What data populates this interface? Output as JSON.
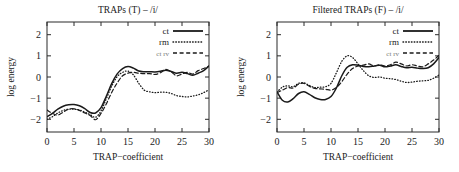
{
  "chart_data": [
    {
      "type": "line",
      "panel": "left",
      "title": "TRAPs (T) – /i/",
      "xlabel": "TRAP−coefficient",
      "ylabel": "log energy",
      "xlim": [
        0,
        30
      ],
      "ylim": [
        -2.6,
        2.6
      ],
      "xticks": [
        0,
        5,
        10,
        15,
        20,
        25,
        30
      ],
      "yticks": [
        2,
        1,
        0,
        -1,
        -2
      ],
      "xticklabels": [
        "0",
        "5",
        "10",
        "15",
        "20",
        "25",
        "30"
      ],
      "yticklabels": [
        "2",
        "1",
        "0",
        "−1",
        "−2"
      ],
      "grid": false,
      "legend_position": "top-right",
      "legend": [
        "ct",
        "rm",
        "ct rv"
      ],
      "x": [
        0,
        1,
        2,
        3,
        4,
        5,
        6,
        7,
        8,
        9,
        10,
        11,
        12,
        13,
        14,
        15,
        16,
        17,
        18,
        19,
        20,
        21,
        22,
        23,
        24,
        25,
        26,
        27,
        28,
        29,
        30
      ],
      "series": [
        {
          "name": "ct",
          "style": "solid",
          "values": [
            -1.88,
            -1.72,
            -1.52,
            -1.38,
            -1.31,
            -1.3,
            -1.36,
            -1.5,
            -1.68,
            -1.7,
            -1.45,
            -0.9,
            -0.3,
            0.15,
            0.4,
            0.5,
            0.42,
            0.28,
            0.25,
            0.25,
            0.24,
            0.27,
            0.32,
            0.26,
            0.18,
            0.22,
            0.16,
            0.08,
            0.18,
            0.3,
            0.52
          ]
        },
        {
          "name": "rm",
          "style": "dotted",
          "values": [
            -2.0,
            -1.88,
            -1.7,
            -1.58,
            -1.52,
            -1.52,
            -1.56,
            -1.66,
            -1.78,
            -1.9,
            -1.6,
            -1.02,
            -0.42,
            0.02,
            0.22,
            0.28,
            0.1,
            -0.3,
            -0.62,
            -0.7,
            -0.74,
            -0.72,
            -0.72,
            -0.78,
            -0.88,
            -0.92,
            -0.94,
            -0.9,
            -0.84,
            -0.74,
            -0.6
          ]
        },
        {
          "name": "ct rv",
          "style": "dashed",
          "values": [
            -1.56,
            -1.72,
            -1.8,
            -1.66,
            -1.52,
            -1.5,
            -1.58,
            -1.7,
            -1.82,
            -2.02,
            -1.72,
            -1.26,
            -0.72,
            -0.28,
            0.06,
            0.18,
            0.22,
            0.18,
            0.16,
            0.16,
            0.12,
            0.2,
            0.36,
            0.24,
            0.06,
            0.14,
            0.22,
            0.14,
            0.3,
            0.4,
            0.52
          ]
        }
      ]
    },
    {
      "type": "line",
      "panel": "right",
      "title": "Filtered TRAPs (F) – /i/",
      "xlabel": "TRAP−coefficient",
      "ylabel": "log energy",
      "xlim": [
        0,
        30
      ],
      "ylim": [
        -2.6,
        2.6
      ],
      "xticks": [
        0,
        5,
        10,
        15,
        20,
        25,
        30
      ],
      "yticks": [
        2,
        1,
        0,
        -1,
        -2
      ],
      "xticklabels": [
        "0",
        "5",
        "10",
        "15",
        "20",
        "25",
        "30"
      ],
      "yticklabels": [
        "2",
        "1",
        "0",
        "−1",
        "−2"
      ],
      "grid": false,
      "legend_position": "top-right",
      "legend": [
        "ct",
        "rm",
        "ct rv"
      ],
      "x": [
        0,
        1,
        2,
        3,
        4,
        5,
        6,
        7,
        8,
        9,
        10,
        11,
        12,
        13,
        14,
        15,
        16,
        17,
        18,
        19,
        20,
        21,
        22,
        23,
        24,
        25,
        26,
        27,
        28,
        29,
        30
      ],
      "series": [
        {
          "name": "ct",
          "style": "solid",
          "values": [
            -0.7,
            -1.1,
            -1.18,
            -1.02,
            -0.78,
            -0.7,
            -0.82,
            -0.98,
            -1.06,
            -1.06,
            -0.92,
            -0.52,
            0.06,
            0.46,
            0.58,
            0.56,
            0.5,
            0.48,
            0.52,
            0.56,
            0.48,
            0.52,
            0.58,
            0.5,
            0.44,
            0.46,
            0.42,
            0.4,
            0.44,
            0.62,
            0.92
          ]
        },
        {
          "name": "rm",
          "style": "dotted",
          "values": [
            -0.72,
            -0.48,
            -0.42,
            -0.46,
            -0.3,
            -0.28,
            -0.4,
            -0.5,
            -0.48,
            -0.46,
            -0.3,
            0.2,
            0.74,
            1.0,
            0.92,
            0.62,
            0.3,
            0.06,
            -0.02,
            0.0,
            -0.06,
            -0.08,
            -0.12,
            -0.2,
            -0.26,
            -0.24,
            -0.2,
            -0.18,
            -0.16,
            -0.06,
            0.1
          ]
        },
        {
          "name": "ct rv",
          "style": "dashed",
          "values": [
            -0.74,
            -0.62,
            -0.5,
            -0.52,
            -0.34,
            -0.3,
            -0.44,
            -0.54,
            -0.56,
            -0.58,
            -0.62,
            -0.5,
            -0.22,
            0.14,
            0.4,
            0.52,
            0.56,
            0.62,
            0.52,
            0.58,
            0.52,
            0.58,
            0.7,
            0.62,
            0.52,
            0.58,
            0.52,
            0.48,
            0.62,
            0.8,
            1.02
          ]
        }
      ]
    }
  ],
  "layout": {
    "plot": {
      "left_panel_x": 47,
      "right_panel_x": 277,
      "plot_top": 22,
      "plot_bottom": 132,
      "plot_width": 162
    }
  }
}
